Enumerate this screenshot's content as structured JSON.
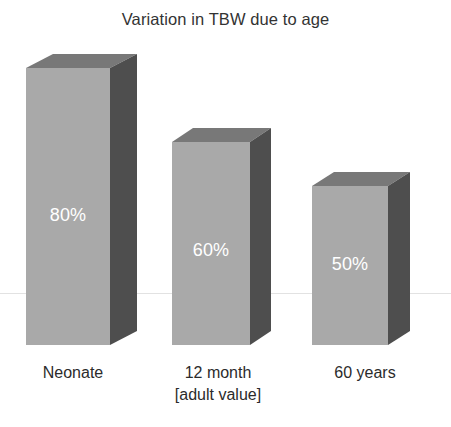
{
  "chart_data": {
    "type": "bar",
    "title": "Variation in TBW due to age",
    "xlabel": "",
    "ylabel": "",
    "ylim": [
      0,
      100
    ],
    "grid": false,
    "legend": null,
    "categories": [
      "Neonate",
      "12 month",
      "60 years"
    ],
    "category_sublabels": [
      "",
      "[adult value]",
      ""
    ],
    "values": [
      80,
      60,
      50
    ],
    "value_labels": [
      "80%",
      "60%",
      "50%"
    ],
    "units": "%",
    "style": "3d-bar"
  },
  "colors": {
    "bar_front": "#a9a9a9",
    "bar_top": "#787878",
    "bar_side": "#4e4e4e",
    "value_text": "#ffffff",
    "title_text": "#333333",
    "label_text": "#2b2b2b",
    "background": "#ffffff",
    "rule": "#e2e2e2"
  },
  "bars": [
    {
      "name": "Neonate",
      "value_label": "80%",
      "left": 26,
      "width": 84,
      "height": 277,
      "depth_x": 27,
      "depth_y": 14,
      "value_top": 205
    },
    {
      "name": "12 month",
      "value_label": "60%",
      "left": 172,
      "width": 78,
      "height": 203,
      "depth_x": 21,
      "depth_y": 14,
      "value_top": 240
    },
    {
      "name": "60 years",
      "value_label": "50%",
      "left": 312,
      "width": 76,
      "height": 159,
      "depth_x": 22,
      "depth_y": 14,
      "value_top": 254
    }
  ],
  "category_labels": [
    {
      "main": "Neonate",
      "sub": "",
      "left": 8,
      "width": 130
    },
    {
      "main": "12 month",
      "sub": "[adult value]",
      "left": 153,
      "width": 130
    },
    {
      "main": "60 years",
      "sub": "",
      "left": 300,
      "width": 130
    }
  ]
}
